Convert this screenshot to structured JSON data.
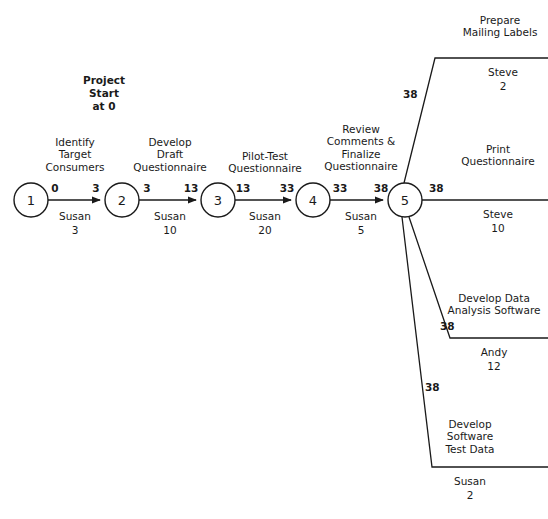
{
  "diagram": {
    "start_note": "Project\nStart\nat 0",
    "nodes": [
      {
        "id": "1",
        "label": "1",
        "cx": 31,
        "cy": 200,
        "r": 17
      },
      {
        "id": "2",
        "label": "2",
        "cx": 122,
        "cy": 200,
        "r": 17
      },
      {
        "id": "3",
        "label": "3",
        "cx": 218,
        "cy": 200,
        "r": 17
      },
      {
        "id": "4",
        "label": "4",
        "cx": 313,
        "cy": 200,
        "r": 17
      },
      {
        "id": "5",
        "label": "5",
        "cx": 405,
        "cy": 200,
        "r": 17
      }
    ],
    "activities": [
      {
        "name": "Identify\nTarget\nConsumers",
        "resource": "Susan",
        "duration": "3",
        "early_start": "0",
        "early_finish": "3",
        "from": "1",
        "to": "2"
      },
      {
        "name": "Develop\nDraft\nQuestionnaire",
        "resource": "Susan",
        "duration": "10",
        "early_start": "3",
        "early_finish": "13",
        "from": "2",
        "to": "3"
      },
      {
        "name": "Pilot-Test\nQuestionnaire",
        "resource": "Susan",
        "duration": "20",
        "early_start": "13",
        "early_finish": "33",
        "from": "3",
        "to": "4"
      },
      {
        "name": "Review\nComments &\nFinalize\nQuestionnaire",
        "resource": "Susan",
        "duration": "5",
        "early_start": "33",
        "early_finish": "38",
        "from": "4",
        "to": "5"
      },
      {
        "name": "Prepare\nMailing Labels",
        "resource": "Steve",
        "duration": "2",
        "early_start": "38",
        "early_finish": "",
        "from": "5",
        "to": ""
      },
      {
        "name": "Print\nQuestionnaire",
        "resource": "Steve",
        "duration": "10",
        "early_start": "38",
        "early_finish": "",
        "from": "5",
        "to": ""
      },
      {
        "name": "Develop Data\nAnalysis Software",
        "resource": "Andy",
        "duration": "12",
        "early_start": "38",
        "early_finish": "",
        "from": "5",
        "to": ""
      },
      {
        "name": "Develop\nSoftware\nTest Data",
        "resource": "Susan",
        "duration": "2",
        "early_start": "38",
        "early_finish": "",
        "from": "5",
        "to": ""
      }
    ],
    "colors": {
      "line": "#1a1a1a",
      "text": "#1a1a1a",
      "background": "#ffffff"
    }
  }
}
